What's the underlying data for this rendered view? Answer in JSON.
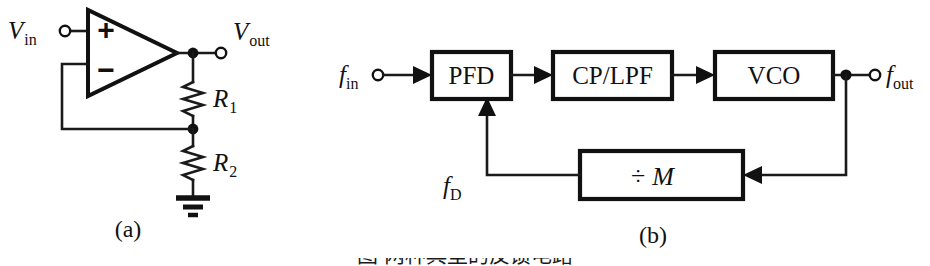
{
  "figure": {
    "width": 930,
    "height": 266,
    "background": "#ffffff",
    "ink_color": "#111111",
    "panel_labels": {
      "left": "(a)",
      "right": "(b)"
    },
    "caption_partial": "图 两种典型的反馈电路"
  },
  "panel_a": {
    "title": "(a)",
    "type": "non-inverting-op-amp-amplifier",
    "labels": {
      "input": {
        "symbol": "V",
        "subscript": "in"
      },
      "output": {
        "symbol": "V",
        "subscript": "out"
      },
      "resistor_top": {
        "symbol": "R",
        "subscript": "1"
      },
      "resistor_bottom": {
        "symbol": "R",
        "subscript": "2"
      },
      "plus_terminal": "+",
      "minus_terminal": "−"
    },
    "components": [
      {
        "name": "op-amp",
        "kind": "triangle"
      },
      {
        "name": "resistor-r1",
        "kind": "zigzag"
      },
      {
        "name": "resistor-r2",
        "kind": "zigzag"
      },
      {
        "name": "ground",
        "kind": "three-bar-ground"
      },
      {
        "name": "input-terminal",
        "kind": "open-circle"
      },
      {
        "name": "output-terminal",
        "kind": "open-circle"
      },
      {
        "name": "output-node",
        "kind": "solid-dot"
      },
      {
        "name": "feedback-node",
        "kind": "solid-dot"
      }
    ]
  },
  "panel_b": {
    "title": "(b)",
    "type": "phase-locked-loop-block-diagram",
    "labels": {
      "input": {
        "symbol": "f",
        "subscript": "in"
      },
      "output": {
        "symbol": "f",
        "subscript": "out"
      },
      "feedback": {
        "symbol": "f",
        "subscript": "D"
      }
    },
    "blocks": [
      {
        "name": "pfd",
        "text": "PFD"
      },
      {
        "name": "cp-lpf",
        "text": "CP/LPF"
      },
      {
        "name": "vco",
        "text": "VCO"
      },
      {
        "name": "divider",
        "text_symbol": "÷",
        "text_var": "M"
      }
    ],
    "signal_flow": [
      "f_in → PFD",
      "PFD → CP/LPF",
      "CP/LPF → VCO",
      "VCO → f_out",
      "VCO → ÷M",
      "÷M → f_D → PFD"
    ]
  }
}
